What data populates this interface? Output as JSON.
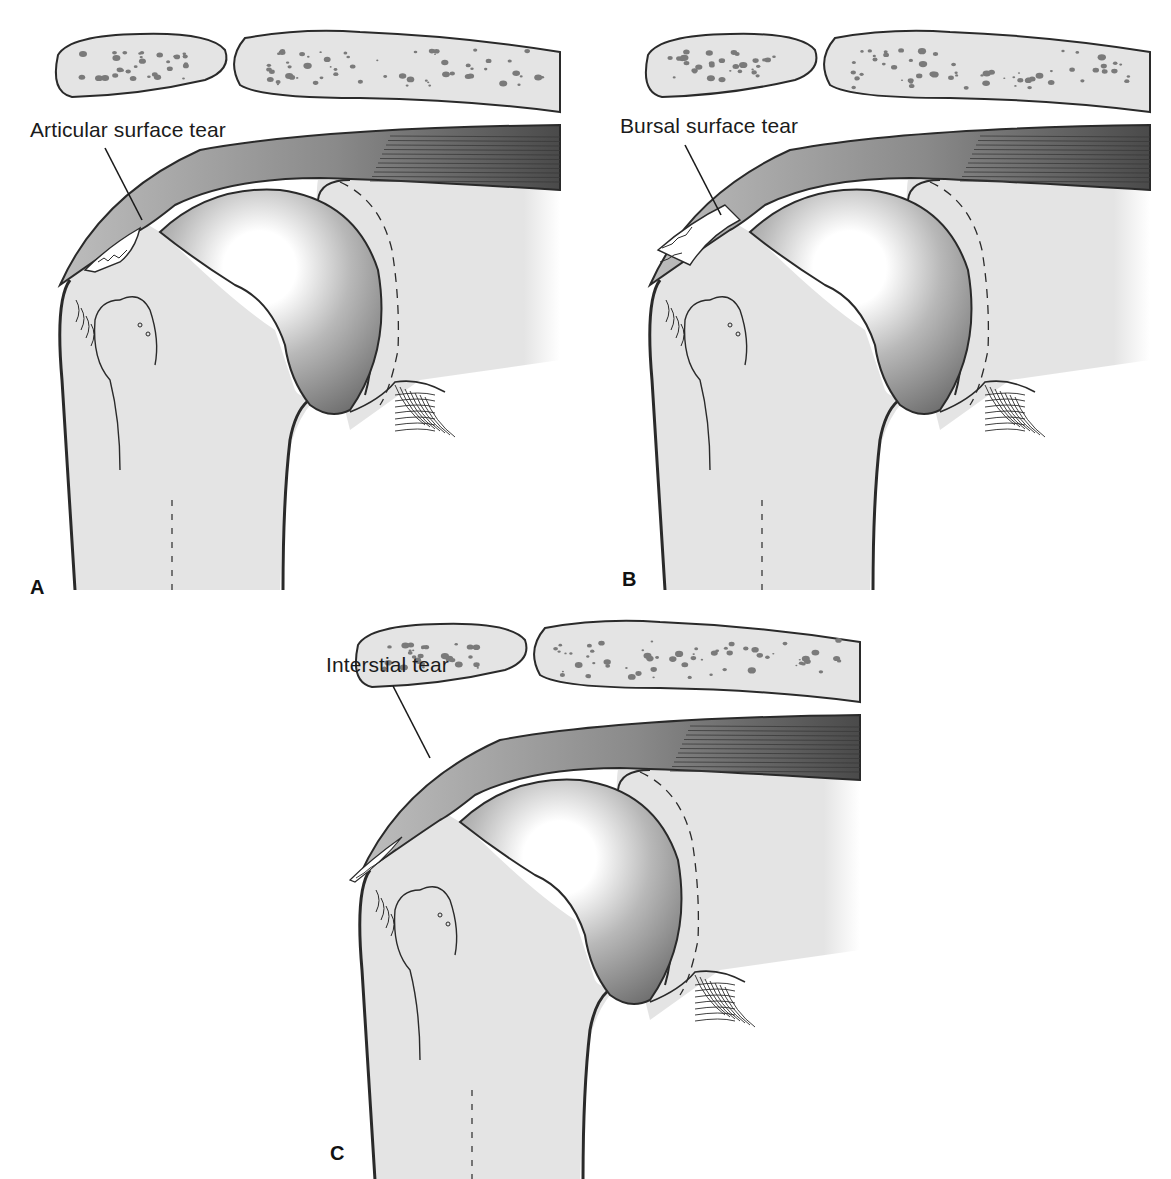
{
  "figure": {
    "colors": {
      "bone_fill": "#e4e4e4",
      "outline": "#2a2a2a",
      "tendon_fill": "#bdbdbd",
      "muscle_fill": "#6e6e6e",
      "humeral_head_dark": "#6f6f6f",
      "humeral_head_light": "#ffffff",
      "trabecular_spots": "#7a7a7a"
    },
    "panels": [
      {
        "id": "A",
        "label": "A",
        "callout": "Articular surface tear",
        "tear_type": "articular"
      },
      {
        "id": "B",
        "label": "B",
        "callout": "Bursal surface tear",
        "tear_type": "bursal"
      },
      {
        "id": "C",
        "label": "C",
        "callout": "Interstial tear",
        "tear_type": "interstitial"
      }
    ]
  }
}
